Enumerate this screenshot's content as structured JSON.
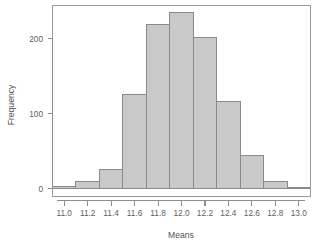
{
  "chart_data": {
    "type": "bar",
    "title": "",
    "subtitle": "",
    "xlabel": "Means",
    "ylabel": "Frequency",
    "grid": false,
    "legend": false,
    "legend_position": "none",
    "xlim": [
      10.9,
      13.1
    ],
    "ylim": [
      0,
      245
    ],
    "bin_width": 0.2,
    "xticks": [
      11.0,
      11.2,
      11.4,
      11.6,
      11.8,
      12.0,
      12.2,
      12.4,
      12.6,
      12.8,
      13.0
    ],
    "xtick_labels": [
      "11.0",
      "11.2",
      "11.4",
      "11.6",
      "11.8",
      "12.0",
      "12.2",
      "12.4",
      "12.6",
      "12.8",
      "13.0"
    ],
    "yticks": [
      0,
      100,
      200
    ],
    "ytick_labels": [
      "0",
      "100",
      "200"
    ],
    "bin_edges": [
      10.9,
      11.1,
      11.3,
      11.5,
      11.7,
      11.9,
      12.1,
      12.3,
      12.5,
      12.7,
      12.9,
      13.1
    ],
    "categories": [
      "10.9-11.1",
      "11.1-11.3",
      "11.3-11.5",
      "11.5-11.7",
      "11.7-11.9",
      "11.9-12.1",
      "12.1-12.3",
      "12.3-12.5",
      "12.5-12.7",
      "12.7-12.9",
      "12.9-13.1"
    ],
    "values": [
      3,
      10,
      25,
      126,
      219,
      235,
      201,
      116,
      44,
      9,
      2
    ],
    "bar_fill_color": "#c9c9c9",
    "bar_border_color": "#8a8a8a",
    "axis_color": "#8d8d8d",
    "text_color": "#5e5e5e"
  },
  "axes": {
    "x_title": "Means",
    "y_title": "Frequency"
  }
}
